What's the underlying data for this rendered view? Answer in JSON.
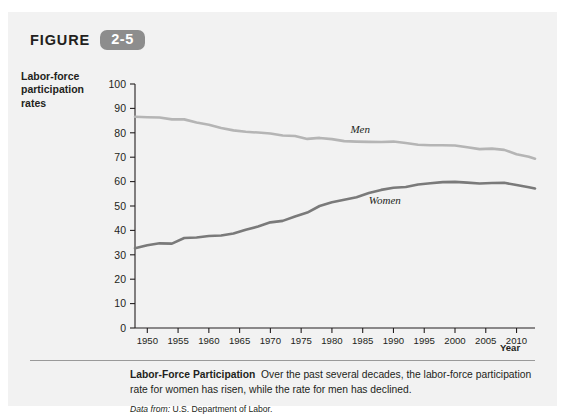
{
  "figure": {
    "label": "FIGURE",
    "number": "2-5"
  },
  "axes": {
    "y_title_lines": [
      "Labor-force",
      "participation",
      "rates"
    ],
    "x_title": "Year"
  },
  "caption": {
    "title": "Labor-Force Participation",
    "body": "Over the past several decades, the labor-force participation rate for women has risen, while the rate for men has declined.",
    "source_label": "Data from:",
    "source_text": "U.S. Department of Labor."
  },
  "colors": {
    "panel_background": "#f2f2f2",
    "badge": "#8d8d8d",
    "men_line": "#b5b5b5",
    "women_line": "#7a7a7a",
    "axis": "#231f20"
  },
  "chart_data": {
    "type": "line",
    "title": "Labor-Force Participation",
    "xlabel": "Year",
    "ylabel": "Labor-force participation rates",
    "xlim": [
      1948,
      2013
    ],
    "ylim": [
      0,
      100
    ],
    "ytick_labels": [
      "0",
      "10",
      "20",
      "30",
      "40",
      "50",
      "60",
      "70",
      "80",
      "90",
      "100"
    ],
    "ytick_values": [
      0,
      10,
      20,
      30,
      40,
      50,
      60,
      70,
      80,
      90,
      100
    ],
    "xtick_labels": [
      "1950",
      "1955",
      "1960",
      "1965",
      "1970",
      "1975",
      "1980",
      "1985",
      "1990",
      "1995",
      "2000",
      "2005",
      "2010"
    ],
    "xtick_values": [
      1950,
      1955,
      1960,
      1965,
      1970,
      1975,
      1980,
      1985,
      1990,
      1995,
      2000,
      2005,
      2010
    ],
    "grid": false,
    "legend": "inline-labels",
    "x": [
      1948,
      1950,
      1952,
      1954,
      1956,
      1958,
      1960,
      1962,
      1964,
      1966,
      1968,
      1970,
      1972,
      1974,
      1976,
      1978,
      1980,
      1982,
      1984,
      1986,
      1988,
      1990,
      1992,
      1994,
      1996,
      1998,
      2000,
      2002,
      2004,
      2006,
      2008,
      2010,
      2012,
      2013
    ],
    "series": [
      {
        "name": "Men",
        "color": "#b5b5b5",
        "label_x": 1983,
        "label_y": 80,
        "values": [
          86.6,
          86.4,
          86.3,
          85.5,
          85.5,
          84.2,
          83.3,
          82.0,
          81.0,
          80.4,
          80.1,
          79.7,
          78.9,
          78.7,
          77.5,
          77.9,
          77.4,
          76.6,
          76.4,
          76.3,
          76.2,
          76.4,
          75.8,
          75.1,
          74.9,
          74.9,
          74.8,
          74.1,
          73.3,
          73.5,
          73.0,
          71.2,
          70.2,
          69.4
        ]
      },
      {
        "name": "Women",
        "color": "#7a7a7a",
        "label_x": 1986,
        "label_y": 51,
        "values": [
          32.7,
          33.9,
          34.7,
          34.6,
          36.9,
          37.1,
          37.7,
          37.9,
          38.7,
          40.3,
          41.6,
          43.3,
          43.9,
          45.7,
          47.3,
          50.0,
          51.5,
          52.6,
          53.6,
          55.3,
          56.6,
          57.5,
          57.8,
          58.8,
          59.3,
          59.8,
          59.9,
          59.6,
          59.2,
          59.4,
          59.5,
          58.6,
          57.7,
          57.2
        ]
      }
    ]
  }
}
